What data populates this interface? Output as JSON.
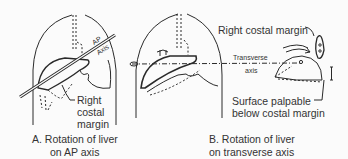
{
  "figure": {
    "panel_a": {
      "labels": {
        "axis_line1": "AP",
        "axis_line2": "Axis",
        "margin_line1": "Right",
        "margin_line2": "costal",
        "margin_line3": "margin"
      },
      "caption_line1": "A. Rotation of liver",
      "caption_line2": "on AP axis"
    },
    "panel_b": {
      "labels": {
        "transverse_line1": "Transverse",
        "transverse_line2": "axis",
        "costal_margin": "Right costal margin",
        "surface_line1": "Surface palpable",
        "surface_line2": "below costal margin"
      },
      "caption_line1": "B. Rotation of liver",
      "caption_line2": "on transverse axis"
    }
  }
}
